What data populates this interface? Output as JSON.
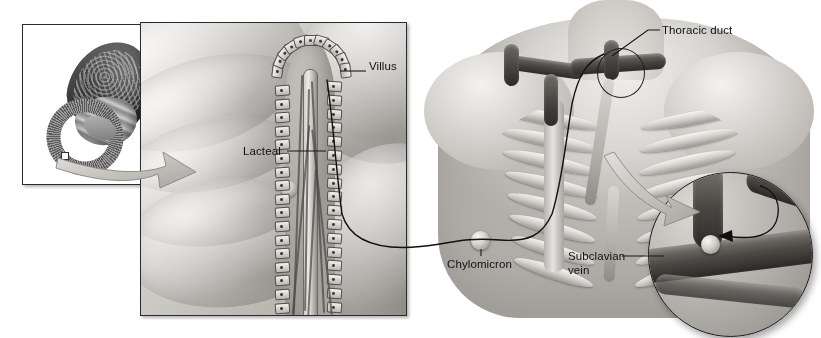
{
  "figure": {
    "background_color": "#ffffff",
    "width": 821,
    "height": 338,
    "style": "grayscale medical illustration"
  },
  "labels": [
    {
      "id": "villus",
      "text": "Villus",
      "x": 369,
      "y": 66,
      "leader": "horizontal-left"
    },
    {
      "id": "lacteal",
      "text": "Lacteal",
      "x": 243,
      "y": 146,
      "leader": "horizontal-right"
    },
    {
      "id": "thoracic_duct",
      "text": "Thoracic duct",
      "x": 662,
      "y": 26,
      "leader": "diagonal-down-left"
    },
    {
      "id": "chylomicron",
      "text": "Chylomicron",
      "x": 447,
      "y": 258,
      "leader": "vertical-up"
    },
    {
      "id": "subclavian_vein_line1",
      "text": "Subclavian",
      "x": 568,
      "y": 256,
      "leader": "horizontal-right"
    },
    {
      "id": "subclavian_vein_line2",
      "text": "vein",
      "x": 568,
      "y": 269,
      "leader": "none"
    }
  ],
  "panels": {
    "stomach_inset": {
      "name": "stomach and duodenum inset",
      "x": 22,
      "y": 24,
      "width": 147,
      "height": 161,
      "border_color": "#2b2b2b",
      "background": "#ffffff",
      "contents": [
        "stomach",
        "duodenum",
        "biopsy-marker"
      ]
    },
    "villus_panel": {
      "name": "intestinal villus cross-section",
      "x": 140,
      "y": 22,
      "width": 267,
      "height": 294,
      "border_color": "#2b2b2b",
      "contents": [
        "mucosal folds",
        "villus",
        "epithelial cells",
        "lacteal",
        "capillary network",
        "chylomicron"
      ]
    },
    "thorax_art": {
      "name": "upper thorax with ribcage and lymphatic vessels",
      "x": 418,
      "y": 0,
      "width": 403,
      "height": 330,
      "contents": [
        "torso",
        "shoulders",
        "ribcage",
        "sternum",
        "thoracic duct",
        "subclavian veins"
      ]
    },
    "magnified_inset": {
      "name": "magnified junction of thoracic duct and subclavian vein",
      "x": 648,
      "y": 172,
      "diameter": 163,
      "border_color": "#1b1b1b",
      "contents": [
        "thoracic duct",
        "subclavian vein",
        "chylomicron entering vein",
        "direction arrow"
      ]
    },
    "duct_circle_marker": {
      "name": "circle marking magnified region",
      "x": 597,
      "y": 48,
      "width": 46,
      "height": 48
    }
  },
  "arrows": [
    {
      "id": "stomach-to-villus",
      "style": "curved block arrow",
      "from": "stomach inset",
      "to": "villus panel",
      "color": "#b9b6b0"
    },
    {
      "id": "thorax-to-magnified",
      "style": "curved block arrow",
      "from": "duct circle marker",
      "to": "magnified inset",
      "color": "#d2cfca"
    },
    {
      "id": "chylomicron-entry",
      "style": "thin curved arrow",
      "from": "thoracic duct",
      "to": "subclavian vein lumen",
      "color": "#101010"
    }
  ],
  "transport_path": {
    "id": "chylomicron-path",
    "description": "black line tracing chylomicron route from lacteal through thoracic duct to subclavian vein",
    "color": "#101010",
    "particle": {
      "x": 471,
      "y": 231,
      "diameter": 19
    }
  },
  "colors": {
    "line": "#101010",
    "panel_border": "#2b2b2b",
    "label_text": "#111111",
    "tissue_light": "#e3e1dd",
    "tissue_mid": "#b9b6b0",
    "vessel_dark": "#46443f",
    "background": "#ffffff"
  }
}
